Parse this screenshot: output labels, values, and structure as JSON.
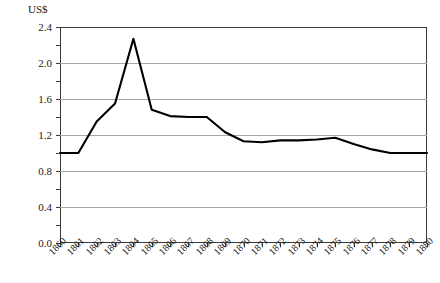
{
  "axis_unit_label": "US$",
  "chart_data": {
    "type": "line",
    "title": "",
    "subtitle": "",
    "xlabel": "",
    "ylabel": "US$",
    "grid": true,
    "legend": "none",
    "xlim": [
      1860,
      1880
    ],
    "ylim": [
      0.0,
      2.4
    ],
    "ytick_step": 0.4,
    "yminor_step": 0.2,
    "ytick_labels": [
      "0.0",
      "0.4",
      "0.8",
      "1.2",
      "1.6",
      "2.0",
      "2.4"
    ],
    "ytick_values": [
      0.0,
      0.4,
      0.8,
      1.2,
      1.6,
      2.0,
      2.4
    ],
    "categories": [
      "1860",
      "1861",
      "1862",
      "1863",
      "1864",
      "1865",
      "1866",
      "1867",
      "1868",
      "1869",
      "1870",
      "1871",
      "1872",
      "1873",
      "1874",
      "1875",
      "1876",
      "1877",
      "1878",
      "1879",
      "1880"
    ],
    "x": [
      1860,
      1861,
      1862,
      1863,
      1864,
      1865,
      1866,
      1867,
      1868,
      1869,
      1870,
      1871,
      1872,
      1873,
      1874,
      1875,
      1876,
      1877,
      1878,
      1879,
      1880
    ],
    "values": [
      1.0,
      1.0,
      1.35,
      1.55,
      2.27,
      1.48,
      1.41,
      1.4,
      1.4,
      1.23,
      1.13,
      1.12,
      1.14,
      1.14,
      1.15,
      1.17,
      1.1,
      1.04,
      1.0,
      1.0,
      1.0
    ],
    "series": [
      {
        "name": "Price",
        "values": [
          1.0,
          1.0,
          1.35,
          1.55,
          2.27,
          1.48,
          1.41,
          1.4,
          1.4,
          1.23,
          1.13,
          1.12,
          1.14,
          1.14,
          1.15,
          1.17,
          1.1,
          1.04,
          1.0,
          1.0,
          1.0
        ],
        "color": "#000000"
      }
    ]
  },
  "colors": {
    "line": "#000000",
    "grid": "#a8a8a8",
    "frame": "#3a3a3a",
    "background": "#ffffff",
    "text": "#1a1a1a"
  }
}
